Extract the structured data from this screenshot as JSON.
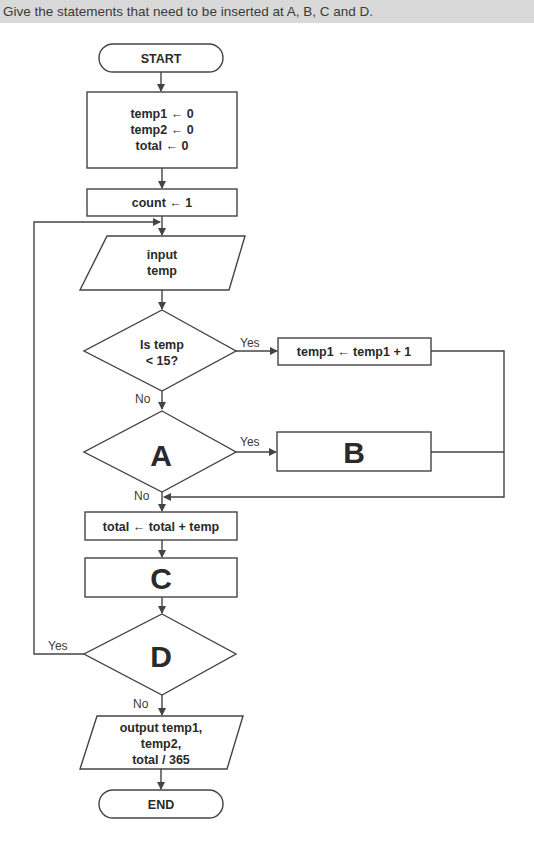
{
  "instruction": "Give the statements that need to be inserted at A, B, C and D.",
  "flowchart": {
    "start": "START",
    "init": [
      "temp1 ← 0",
      "temp2 ← 0",
      "total ← 0"
    ],
    "count_init": "count ← 1",
    "input": [
      "input",
      "temp"
    ],
    "decision1": [
      "Is temp",
      "< 15?"
    ],
    "decision1_yes": "Yes",
    "decision1_no": "No",
    "process_temp1": "temp1 ← temp1 + 1",
    "decision_a": "A",
    "decision_a_yes": "Yes",
    "decision_a_no": "No",
    "process_b": "B",
    "process_total": "total ← total + temp",
    "process_c": "C",
    "decision_d": "D",
    "decision_d_yes": "Yes",
    "decision_d_no": "No",
    "output": [
      "output temp1,",
      "temp2,",
      "total / 365"
    ],
    "end": "END"
  },
  "colors": {
    "header_bg": "#d9d9d9",
    "stroke": "#444444",
    "text": "#2a2a2a"
  }
}
